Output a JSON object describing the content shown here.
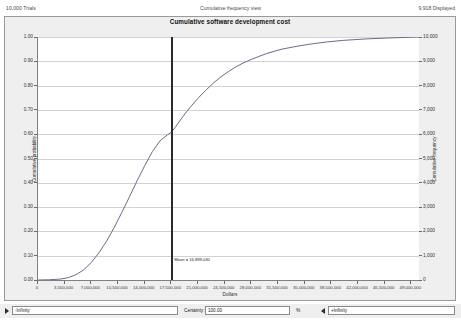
{
  "header": {
    "trials": "10,000 Trials",
    "view_name": "Cumulative frequency view",
    "displayed": "9,918 Displayed"
  },
  "chart_title": "Cumulative software development cost",
  "controls": {
    "min_arrow_icon": "triangle-right-icon",
    "min_value": "-Infinity",
    "certainty_label": "Certainty:",
    "certainty_value": "100.00",
    "percent_symbol": "%",
    "max_arrow_icon": "triangle-left-icon",
    "max_value": "+Infinity"
  },
  "annotation": {
    "label": "Mean = 16,899,030",
    "x_value": 17500000
  },
  "chart_data": {
    "type": "line",
    "title": "Cumulative software development cost",
    "xlabel": "Dollars",
    "ylabel": "Cumulative probability",
    "y2label": "Cumulative frequency",
    "xlim": [
      0,
      50000000
    ],
    "ylim": [
      0,
      1.0
    ],
    "y2lim": [
      0,
      10000
    ],
    "grid": true,
    "legend": null,
    "xticks": [
      0,
      3500000,
      7000000,
      10500000,
      14000000,
      17500000,
      21000000,
      24500000,
      28000000,
      31500000,
      35000000,
      38500000,
      42000000,
      45500000,
      49000000
    ],
    "xticklabels": [
      "0",
      "3,500,000",
      "7,000,000",
      "10,500,000",
      "14,000,000",
      "17,500,000",
      "21,000,000",
      "24,500,000",
      "28,000,000",
      "31,500,000",
      "35,000,000",
      "38,500,000",
      "42,000,000",
      "45,500,000",
      "49,000,000"
    ],
    "yticks": [
      0.0,
      0.1,
      0.2,
      0.3,
      0.4,
      0.5,
      0.6,
      0.7,
      0.8,
      0.9,
      1.0
    ],
    "yticklabels": [
      "0.00",
      "0.10",
      "0.20",
      "0.30",
      "0.40",
      "0.50",
      "0.60",
      "0.70",
      "0.80",
      "0.90",
      "1.00"
    ],
    "y2ticks": [
      0,
      1000,
      2000,
      3000,
      4000,
      5000,
      6000,
      7000,
      8000,
      9000,
      10000
    ],
    "y2ticklabels": [
      "0",
      "1,000",
      "2,000",
      "3,000",
      "4,000",
      "5,000",
      "6,000",
      "7,000",
      "8,000",
      "9,000",
      "10,000"
    ],
    "line_color": "#6b6b8a",
    "reference_line_color": "#2a2a2a",
    "series": [
      {
        "name": "Cumulative probability",
        "x": [
          0,
          1500000,
          3000000,
          4000000,
          5000000,
          6000000,
          7000000,
          8000000,
          9000000,
          10000000,
          11000000,
          12000000,
          13000000,
          14000000,
          15000000,
          16000000,
          17000000,
          17500000,
          18000000,
          19000000,
          20000000,
          21000000,
          22000000,
          23000000,
          24000000,
          25000000,
          26000000,
          27000000,
          28000000,
          30000000,
          32000000,
          34000000,
          36000000,
          38000000,
          40000000,
          43000000,
          46000000,
          50000000
        ],
        "y": [
          0.0,
          0.001,
          0.004,
          0.01,
          0.022,
          0.042,
          0.072,
          0.112,
          0.16,
          0.216,
          0.278,
          0.342,
          0.408,
          0.47,
          0.528,
          0.572,
          0.598,
          0.608,
          0.628,
          0.672,
          0.712,
          0.748,
          0.78,
          0.81,
          0.836,
          0.858,
          0.878,
          0.894,
          0.908,
          0.932,
          0.95,
          0.962,
          0.972,
          0.98,
          0.986,
          0.992,
          0.996,
          1.0
        ]
      }
    ]
  }
}
